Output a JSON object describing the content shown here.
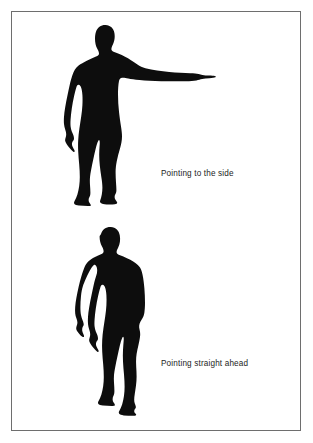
{
  "panel": {
    "background_color": "#ffffff",
    "border_color": "#6e6e6e",
    "silhouette_color": "#0d0d0d"
  },
  "figures": [
    {
      "id": "pointing-side",
      "icon_name": "human-silhouette-pointing-side",
      "caption": "Pointing to the side",
      "description": "Black human silhouette standing frontally with right arm raised horizontally, index finger extended to the viewer's right"
    },
    {
      "id": "pointing-ahead",
      "icon_name": "human-silhouette-pointing-ahead",
      "caption": "Pointing straight ahead",
      "description": "Black human silhouette standing frontally with both arms down at the sides, arm foreshortened pointing toward the viewer"
    }
  ],
  "captions": {
    "pointing_side": "Pointing to the side",
    "pointing_ahead": "Pointing straight ahead"
  }
}
